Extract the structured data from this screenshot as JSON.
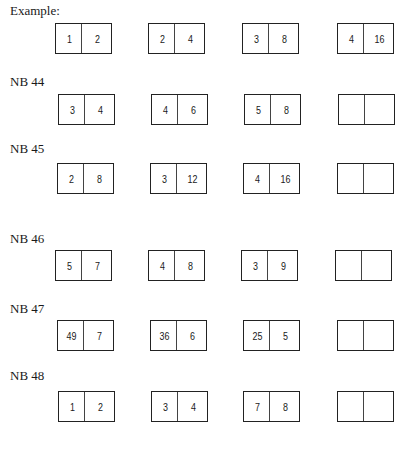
{
  "sections": [
    {
      "label": "Example:",
      "label_top": 4,
      "boxes_top": 23,
      "boxes": [
        {
          "x": 55,
          "left": "1",
          "right": "2"
        },
        {
          "x": 148,
          "left": "2",
          "right": "4"
        },
        {
          "x": 242,
          "left": "3",
          "right": "8"
        },
        {
          "x": 337,
          "left": "4",
          "right": "16"
        }
      ]
    },
    {
      "label": "NB 44",
      "label_top": 75,
      "boxes_top": 94,
      "boxes": [
        {
          "x": 58,
          "left": "3",
          "right": "4"
        },
        {
          "x": 151,
          "left": "4",
          "right": "6"
        },
        {
          "x": 244,
          "left": "5",
          "right": "8"
        },
        {
          "x": 338,
          "left": "",
          "right": ""
        }
      ]
    },
    {
      "label": "NB 45",
      "label_top": 142,
      "boxes_top": 163,
      "boxes": [
        {
          "x": 57,
          "left": "2",
          "right": "8"
        },
        {
          "x": 150,
          "left": "3",
          "right": "12"
        },
        {
          "x": 243,
          "left": "4",
          "right": "16"
        },
        {
          "x": 337,
          "left": "",
          "right": ""
        }
      ]
    },
    {
      "label": "NB 46",
      "label_top": 232,
      "boxes_top": 250,
      "boxes": [
        {
          "x": 55,
          "left": "5",
          "right": "7"
        },
        {
          "x": 148,
          "left": "4",
          "right": "8"
        },
        {
          "x": 241,
          "left": "3",
          "right": "9"
        },
        {
          "x": 335,
          "left": "",
          "right": ""
        }
      ]
    },
    {
      "label": "NB 47",
      "label_top": 302,
      "boxes_top": 320,
      "boxes": [
        {
          "x": 57,
          "left": "49",
          "right": "7"
        },
        {
          "x": 150,
          "left": "36",
          "right": "6"
        },
        {
          "x": 243,
          "left": "25",
          "right": "5"
        },
        {
          "x": 337,
          "left": "",
          "right": ""
        }
      ]
    },
    {
      "label": "NB 48",
      "label_top": 369,
      "boxes_top": 391,
      "boxes": [
        {
          "x": 58,
          "left": "1",
          "right": "2"
        },
        {
          "x": 151,
          "left": "3",
          "right": "4"
        },
        {
          "x": 243,
          "left": "7",
          "right": "8"
        },
        {
          "x": 337,
          "left": "",
          "right": ""
        }
      ]
    }
  ]
}
